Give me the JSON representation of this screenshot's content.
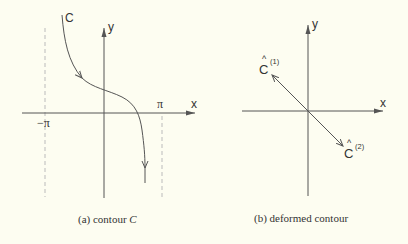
{
  "panel_a": {
    "caption_prefix": "(a) contour ",
    "caption_var": "C",
    "curve_label": "C",
    "x_axis_label": "x",
    "y_axis_label": "y",
    "neg_pi_label": "−π",
    "pi_label": "π"
  },
  "panel_b": {
    "caption": "(b) deformed contour",
    "x_axis_label": "x",
    "y_axis_label": "y",
    "c1_label": "C",
    "c1_hat": "^",
    "c1_sup": "(1)",
    "c2_label": "C",
    "c2_hat": "^",
    "c2_sup": "(2)"
  },
  "colors": {
    "background": "#fdfdf1",
    "stroke": "#555555",
    "dashed": "#bbbbbb"
  }
}
